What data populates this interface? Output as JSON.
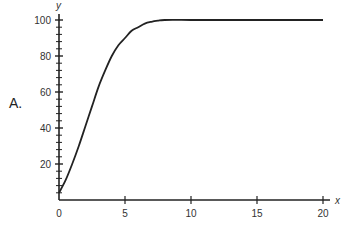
{
  "panel_label": "A.",
  "chart_data": {
    "type": "line",
    "title": "",
    "xlabel": "x",
    "ylabel": "y",
    "xlim": [
      0,
      20
    ],
    "ylim": [
      0,
      100
    ],
    "grid": false,
    "legend": null,
    "x_ticks": [
      0,
      5,
      10,
      15,
      20
    ],
    "x_tick_labels": [
      "0",
      "5",
      "10",
      "15",
      "20"
    ],
    "y_ticks": [
      20,
      40,
      60,
      80,
      100
    ],
    "y_tick_labels": [
      "20",
      "40",
      "60",
      "80",
      "100"
    ],
    "y_minor_tick_step": 4,
    "series": [
      {
        "name": "y",
        "color": "#222222",
        "x": [
          0,
          0.5,
          1,
          1.5,
          2,
          2.5,
          3,
          3.5,
          4,
          4.5,
          5,
          5.5,
          6,
          6.5,
          7,
          7.5,
          8,
          10,
          12,
          14,
          16,
          18,
          20
        ],
        "values": [
          4,
          11,
          20,
          30,
          41,
          52,
          63,
          72,
          80,
          86,
          90,
          94,
          96,
          98,
          99,
          99.6,
          100,
          100,
          100,
          100,
          100,
          100,
          100
        ]
      }
    ]
  },
  "axis_labels": {
    "x": "x",
    "y": "y"
  }
}
